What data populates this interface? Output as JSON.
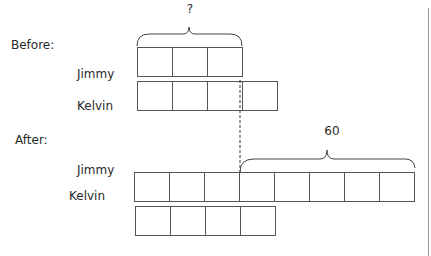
{
  "diagram": {
    "type": "bar-model",
    "before": {
      "heading": "Before:",
      "rows": [
        {
          "name": "Jimmy",
          "units": 3
        },
        {
          "name": "Kelvin",
          "units": 4
        }
      ],
      "brace_label": "?"
    },
    "after": {
      "heading": "After:",
      "rows": [
        {
          "name": "Jimmy",
          "units": 8
        },
        {
          "name": "Kelvin",
          "units": 4
        }
      ],
      "brace_label": "60"
    }
  }
}
